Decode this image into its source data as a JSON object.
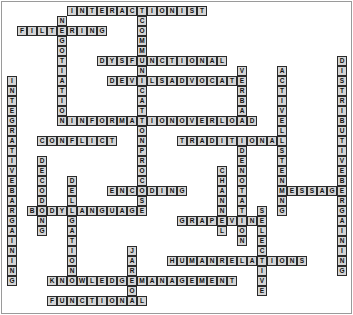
{
  "puzzle": {
    "title": "Communication Terms Crossword",
    "type": "crossword-word-grid",
    "cell_size_px": 10,
    "origin": {
      "x": 7,
      "y": 6
    },
    "grid_colors": {
      "cell_fill": "#d4d4d4",
      "cell_border": "#2b2b2b",
      "letter_color": "#111111",
      "page_background": "#ffffff",
      "frame_border": "#9a9a9a"
    },
    "entries": [
      {
        "name": "interactionist",
        "answer": "INTERACTIONIST",
        "direction": "across",
        "col": 6,
        "row": 0
      },
      {
        "name": "filtering",
        "answer": "FILTERING",
        "direction": "across",
        "col": 1,
        "row": 2
      },
      {
        "name": "dysfunctional",
        "answer": "DYSFUNCTIONAL",
        "direction": "across",
        "col": 9,
        "row": 5
      },
      {
        "name": "devils-advocate",
        "answer": "DEVILSADVOCATE",
        "direction": "across",
        "col": 10,
        "row": 7
      },
      {
        "name": "information-overload",
        "answer": "INFORMATIONOVERLOAD",
        "direction": "across",
        "col": 6,
        "row": 11
      },
      {
        "name": "conflict",
        "answer": "CONFLICT",
        "direction": "across",
        "col": 3,
        "row": 13
      },
      {
        "name": "traditional",
        "answer": "TRADITIONAL",
        "direction": "across",
        "col": 17,
        "row": 13
      },
      {
        "name": "encoding",
        "answer": "ENCODING",
        "direction": "across",
        "col": 10,
        "row": 18
      },
      {
        "name": "message",
        "answer": "MESSAGE",
        "direction": "across",
        "col": 27,
        "row": 18
      },
      {
        "name": "body-language",
        "answer": "BODYLANGUAGE",
        "direction": "across",
        "col": 2,
        "row": 20
      },
      {
        "name": "grapevine",
        "answer": "GRAPEVINE",
        "direction": "across",
        "col": 17,
        "row": 21
      },
      {
        "name": "human-relations",
        "answer": "HUMANRELATIONS",
        "direction": "across",
        "col": 16,
        "row": 25
      },
      {
        "name": "knowledge-management",
        "answer": "KNOWLEDGEMANAGEMENT",
        "direction": "across",
        "col": 4,
        "row": 27
      },
      {
        "name": "functional",
        "answer": "FUNCTIONAL",
        "direction": "across",
        "col": 4,
        "row": 29
      },
      {
        "name": "negotiation",
        "answer": "NEGOTIATION",
        "direction": "down",
        "col": 5,
        "row": 1
      },
      {
        "name": "communication-process",
        "answer": "COMMUNICATIONPROCESS",
        "direction": "down",
        "col": 13,
        "row": 1
      },
      {
        "name": "integrative-bargaining",
        "answer": "INTEGRATIVEBARGAINING",
        "direction": "down",
        "col": 0,
        "row": 7
      },
      {
        "name": "verbal",
        "answer": "VERBAL",
        "direction": "down",
        "col": 23,
        "row": 6
      },
      {
        "name": "active-listening",
        "answer": "ACTIVELISTENING",
        "direction": "down",
        "col": 27,
        "row": 6
      },
      {
        "name": "distributive-bargaining",
        "answer": "DISTRIBUTIVEBARGAINING",
        "direction": "down",
        "col": 33,
        "row": 5
      },
      {
        "name": "decoding",
        "answer": "DECODING",
        "direction": "down",
        "col": 3,
        "row": 15
      },
      {
        "name": "delegation",
        "answer": "DELEGATION",
        "direction": "down",
        "col": 6,
        "row": 17
      },
      {
        "name": "channel",
        "answer": "CHANNEL",
        "direction": "down",
        "col": 21,
        "row": 16
      },
      {
        "name": "denotation",
        "answer": "DENOTATION",
        "direction": "down",
        "col": 23,
        "row": 14
      },
      {
        "name": "selective",
        "answer": "SELECTIVE",
        "direction": "down",
        "col": 25,
        "row": 20
      },
      {
        "name": "jargon",
        "answer": "JARGON",
        "direction": "down",
        "col": 12,
        "row": 24
      }
    ]
  }
}
